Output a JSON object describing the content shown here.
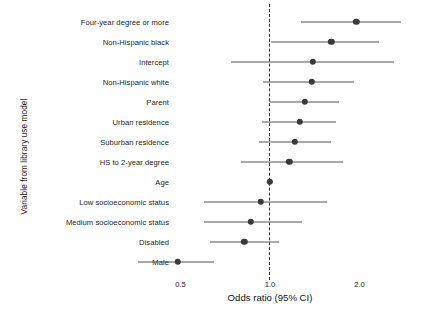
{
  "chart_data": {
    "type": "scatter",
    "subtype": "forest-plot",
    "title": "",
    "xlabel": "Odds ratio (95% CI)",
    "ylabel": "Variable from library use model",
    "xscale": "log",
    "xlim": [
      0.33,
      2.95
    ],
    "xticks": [
      0.5,
      1.0,
      2.0
    ],
    "xtick_labels": [
      "0.5",
      "1.0",
      "2.0"
    ],
    "grid": false,
    "legend": false,
    "reference_line": 1.0,
    "reference_line_style": "dashed",
    "categories": [
      "Four-year degree or more",
      "Non-Hispanic black",
      "Intercept",
      "Non-Hispanic white",
      "Parent",
      "Urban residence",
      "Suburban residence",
      "HS to 2-year degree",
      "Age",
      "Low socioeconomic status",
      "Medium socioeconomic status",
      "Disabled",
      "Male"
    ],
    "odds_ratio": [
      1.95,
      1.61,
      1.39,
      1.38,
      1.31,
      1.26,
      1.21,
      1.16,
      1.0,
      0.93,
      0.86,
      0.82,
      0.49
    ],
    "ci_low": [
      1.27,
      1.01,
      0.74,
      0.95,
      1.0,
      0.94,
      0.92,
      0.8,
      0.98,
      0.6,
      0.6,
      0.63,
      0.36
    ],
    "ci_high": [
      2.76,
      2.33,
      2.61,
      1.92,
      1.71,
      1.67,
      1.6,
      1.76,
      1.02,
      1.55,
      1.28,
      1.07,
      0.65
    ],
    "point_color": "#3a3a3a",
    "line_color": "#555555",
    "reference_color": "#2b2b2b"
  }
}
